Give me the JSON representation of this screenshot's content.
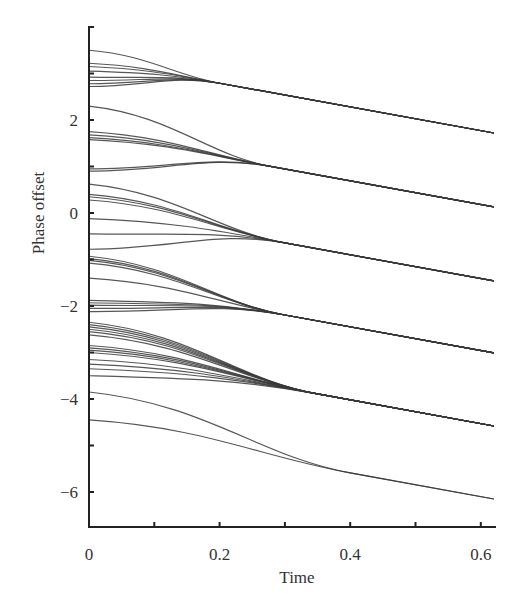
{
  "chart_data": {
    "type": "line",
    "title": "",
    "xlabel": "Time",
    "ylabel": "Phase offset",
    "xlim": [
      0,
      0.62
    ],
    "ylim": [
      -6.8,
      4.0
    ],
    "xticks": [
      0,
      0.2,
      0.4,
      0.6
    ],
    "xtick_labels": [
      "0",
      "0.2",
      "0.4",
      "0.6"
    ],
    "yticks": [
      2,
      0,
      -2,
      -4,
      -6
    ],
    "ytick_labels": [
      "2",
      "0",
      "−2",
      "−4",
      "−6"
    ],
    "grid": false,
    "legend": null,
    "line_color": "#3a3a3a",
    "slope_after_sync": -2.55,
    "clusters": [
      {
        "name": "cluster-1",
        "merge_time": 0.2,
        "value_at_t0.62": 1.72,
        "initial_values": [
          3.5,
          3.22,
          3.15,
          3.05,
          2.92,
          2.85,
          2.78,
          2.72
        ]
      },
      {
        "name": "cluster-2",
        "merge_time": 0.28,
        "value_at_t0.62": 0.13,
        "initial_values": [
          2.3,
          1.75,
          1.68,
          1.62,
          1.58,
          0.95,
          0.9
        ]
      },
      {
        "name": "cluster-3",
        "merge_time": 0.3,
        "value_at_t0.62": -1.46,
        "initial_values": [
          0.62,
          0.4,
          0.35,
          0.28,
          -0.12,
          -0.45,
          -0.78
        ]
      },
      {
        "name": "cluster-4",
        "merge_time": 0.3,
        "value_at_t0.62": -3.01,
        "initial_values": [
          -0.93,
          -0.98,
          -1.02,
          -1.08,
          -1.4,
          -1.88,
          -1.93,
          -1.98,
          -2.05,
          -2.12
        ]
      },
      {
        "name": "cluster-5",
        "merge_time": 0.35,
        "value_at_t0.62": -4.58,
        "initial_values": [
          -2.35,
          -2.4,
          -2.45,
          -2.5,
          -2.55,
          -2.62,
          -2.85,
          -2.9,
          -2.95,
          -3.0,
          -3.15,
          -3.25,
          -3.35,
          -3.5
        ]
      },
      {
        "name": "cluster-6",
        "merge_time": 0.4,
        "value_at_t0.62": -6.15,
        "initial_values": [
          -3.85,
          -4.45
        ]
      }
    ]
  }
}
